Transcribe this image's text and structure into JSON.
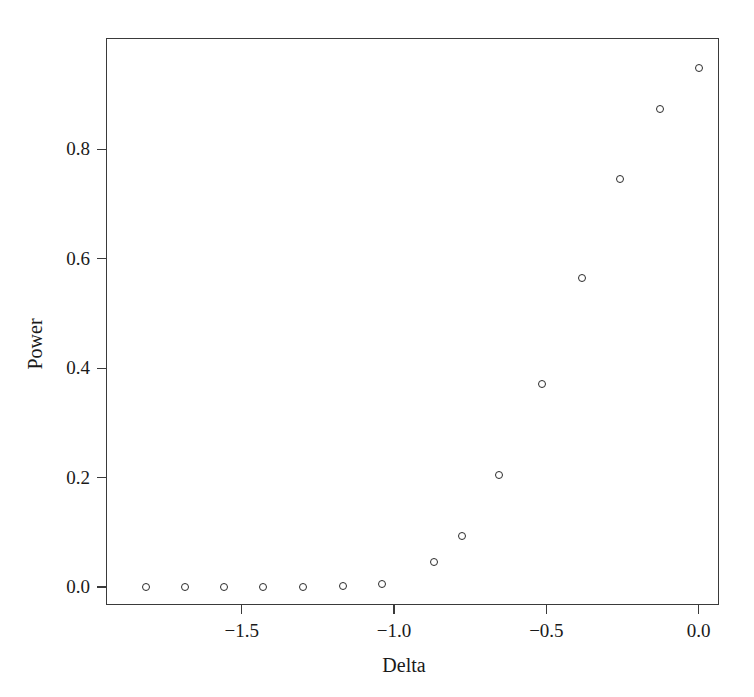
{
  "chart_data": {
    "type": "scatter",
    "title": "",
    "xlabel": "Delta",
    "ylabel": "Power",
    "xlim": [
      -1.9455,
      0.0667
    ],
    "ylim": [
      -0.0328,
      1.0036
    ],
    "grid": false,
    "legend": null,
    "marker": "open-circle",
    "marker_color": "#2b2b2b",
    "xticks": [
      -1.5,
      -1.0,
      -0.5,
      0.0
    ],
    "xtick_labels": [
      "−1.5",
      "−1.0",
      "−0.5",
      "0.0"
    ],
    "yticks": [
      0.0,
      0.2,
      0.4,
      0.6,
      0.8
    ],
    "ytick_labels": [
      "0.0",
      "0.2",
      "0.4",
      "0.6",
      "0.8"
    ],
    "x": [
      -1.813,
      -1.686,
      -1.559,
      -1.429,
      -1.299,
      -1.168,
      -1.038,
      -0.87,
      -0.778,
      -0.654,
      -0.514,
      -0.384,
      -0.257,
      -0.127,
      0.0
    ],
    "y": [
      0.0,
      0.0,
      0.0,
      0.0,
      0.0,
      0.002,
      0.006,
      0.046,
      0.093,
      0.205,
      0.372,
      0.565,
      0.745,
      0.874,
      0.949
    ],
    "points": [
      {
        "x": -1.813,
        "y": 0.0
      },
      {
        "x": -1.686,
        "y": 0.0
      },
      {
        "x": -1.559,
        "y": 0.0
      },
      {
        "x": -1.429,
        "y": 0.0
      },
      {
        "x": -1.299,
        "y": 0.0
      },
      {
        "x": -1.168,
        "y": 0.002
      },
      {
        "x": -1.038,
        "y": 0.006
      },
      {
        "x": -0.87,
        "y": 0.046
      },
      {
        "x": -0.778,
        "y": 0.093
      },
      {
        "x": -0.654,
        "y": 0.205
      },
      {
        "x": -0.514,
        "y": 0.372
      },
      {
        "x": -0.384,
        "y": 0.565
      },
      {
        "x": -0.257,
        "y": 0.745
      },
      {
        "x": -0.127,
        "y": 0.874
      },
      {
        "x": 0.0,
        "y": 0.949
      }
    ]
  },
  "axes": {
    "x_title": "Delta",
    "y_title": "Power"
  }
}
